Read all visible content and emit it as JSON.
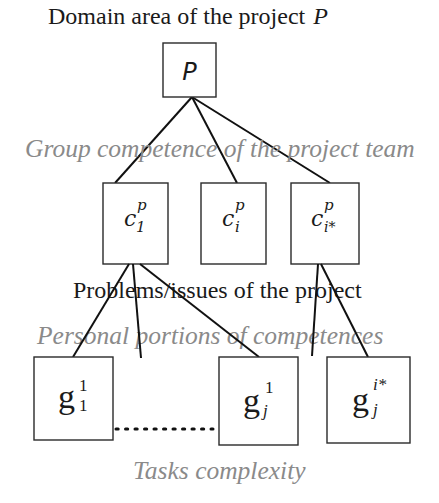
{
  "title": {
    "text": "Domain  area  of the project",
    "symbol": "P"
  },
  "labels": {
    "group_competence": "Group competence of the project team",
    "problems": "Problems/issues of  the project",
    "personal_portions": "Personal portions  of competences",
    "tasks_complexity": "Tasks complexity"
  },
  "nodes": {
    "root": {
      "symbol": "P"
    },
    "competences": [
      {
        "base": "c",
        "sup": "p",
        "sub": "1"
      },
      {
        "base": "c",
        "sup": "p",
        "sub": "i"
      },
      {
        "base": "c",
        "sup": "p",
        "sub": "i*"
      }
    ],
    "tasks": [
      {
        "base": "g",
        "sup": "1",
        "sub": "1"
      },
      {
        "base": "g",
        "sup": "1",
        "sub": "j"
      },
      {
        "base": "g",
        "sup": "i*",
        "sub": "j"
      }
    ],
    "ellipsis": "............"
  },
  "colors": {
    "primary_text": "#1a1a1a",
    "secondary_text": "#8a8a8a",
    "lines": "#111111"
  }
}
